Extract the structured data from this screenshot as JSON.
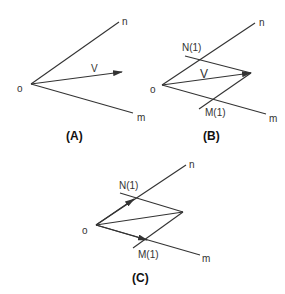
{
  "panels": {
    "A": {
      "caption": "(A)",
      "origin_label": "o",
      "n_label": "n",
      "m_label": "m",
      "v_label": "V"
    },
    "B": {
      "caption": "(B)",
      "origin_label": "o",
      "n_label": "n",
      "m_label": "m",
      "v_label": "V",
      "n1_label": "N(1)",
      "m1_label": "M(1)"
    },
    "C": {
      "caption": "(C)",
      "origin_label": "o",
      "n_label": "n",
      "m_label": "m",
      "n1_label": "N(1)",
      "m1_label": "M(1)"
    }
  },
  "colors": {
    "line": "#333333",
    "background": "#ffffff"
  }
}
